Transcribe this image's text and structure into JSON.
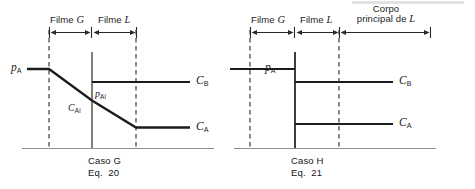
{
  "figure": {
    "title_hidden": "",
    "background_color": "#ffffff",
    "line_color": "#1c1c1c",
    "axis_color": "#8a8a8a"
  },
  "panels": [
    {
      "id": "caso-g",
      "caption_line1": "Caso G",
      "caption_line2": "Eq.  20",
      "regions": [
        {
          "label_text": "Filme ",
          "label_italic": "G"
        },
        {
          "label_text": "Filme ",
          "label_italic": "L"
        }
      ],
      "labels": {
        "p_bulk": "p",
        "p_bulk_sub": "A",
        "p_interface": "p",
        "p_interface_sub": "Ai",
        "c_interface": "C",
        "c_interface_sub": "Ai",
        "c_b": "C",
        "c_b_sub": "B",
        "c_a": "C",
        "c_a_sub": "A"
      }
    },
    {
      "id": "caso-h",
      "caption_line1": "Caso H",
      "caption_line2": "Eq.  21",
      "regions": [
        {
          "label_text": "Filme ",
          "label_italic": "G"
        },
        {
          "label_text": "Filme ",
          "label_italic": "L"
        },
        {
          "label_text": "Corpo\nprincipal de ",
          "label_italic": "L"
        }
      ],
      "labels": {
        "p_bulk": "p",
        "p_bulk_sub": "A",
        "c_b": "C",
        "c_b_sub": "B",
        "c_a": "C",
        "c_a_sub": "A"
      }
    }
  ],
  "region_labels": {
    "corpo_line1": "Corpo",
    "corpo_line2": "principal de ",
    "corpo_italic": "L",
    "filme": "Filme",
    "g_italic": "G",
    "l_italic": "L"
  }
}
